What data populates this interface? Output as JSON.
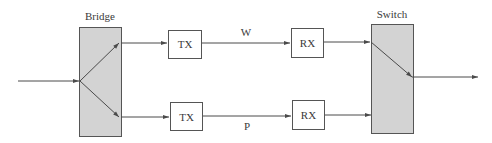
{
  "diagram": {
    "colors": {
      "block_fill": "#d3d3d3",
      "stroke": "#4a4a4a",
      "background": "#ffffff"
    },
    "bridge": {
      "label": "Bridge"
    },
    "switch": {
      "label": "Switch"
    },
    "paths": [
      {
        "id": "working",
        "transmitter": "TX",
        "receiver": "RX",
        "label": "W"
      },
      {
        "id": "protection",
        "transmitter": "TX",
        "receiver": "RX",
        "label": "P"
      }
    ]
  }
}
